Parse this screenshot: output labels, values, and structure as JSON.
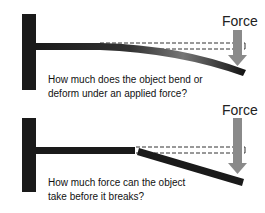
{
  "panels": [
    {
      "force_label": "Force",
      "caption_line1": "How much does the object bend or",
      "caption_line2": "deform under an applied force?",
      "concept": "bending / deformation"
    },
    {
      "force_label": "Force",
      "caption_line1": "How much force can the object",
      "caption_line2": "take before it breaks?",
      "concept": "breaking / fracture"
    }
  ],
  "colors": {
    "wall": "#1a1a1a",
    "beam": "#1a1a1a",
    "arrow": "#8a8a8a",
    "dashed": "#333333",
    "text": "#111111"
  }
}
